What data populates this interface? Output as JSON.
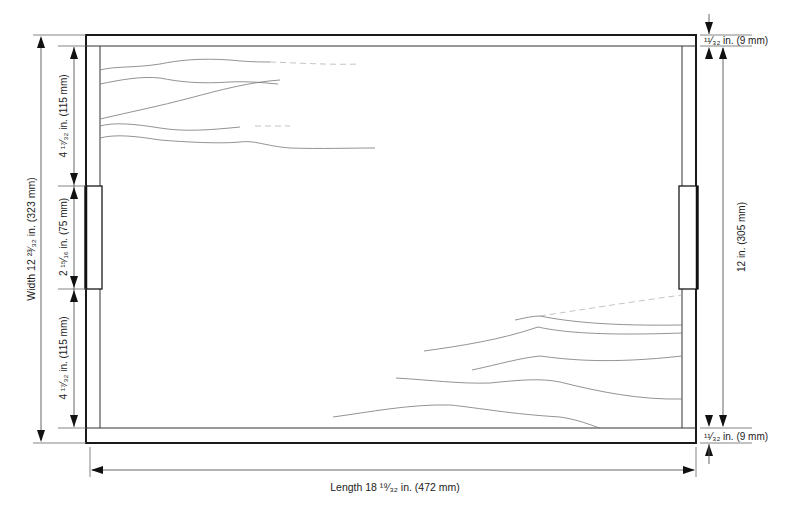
{
  "diagram": {
    "type": "dimensioned technical drawing",
    "dimensions": {
      "width": {
        "label": "Width 12 ²³⁄₃₂ in. (323 mm)"
      },
      "left_top_segment": {
        "label": "4 ¹⁷⁄₃₂ in. (115 mm)"
      },
      "left_handle_segment": {
        "label": "2 ¹⁵⁄₁₆ in. (75 mm)"
      },
      "left_bottom_segment": {
        "label": "4 ¹⁷⁄₃₂ in. (115 mm)"
      },
      "inner_height": {
        "label": "12 in. (305 mm)"
      },
      "top_rail": {
        "label": "¹¹⁄₃₂ in. (9 mm)"
      },
      "bottom_rail": {
        "label": "¹¹⁄₃₂ in. (9 mm)"
      },
      "length": {
        "label": "Length 18 ¹⁹⁄₃₂ in. (472 mm)"
      }
    },
    "colors": {
      "line": "#1a1a1a",
      "dimension_line": "#555555",
      "grain": "#777777",
      "background": "#ffffff"
    }
  }
}
